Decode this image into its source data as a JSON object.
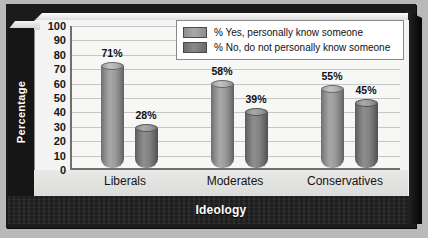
{
  "chart_data": {
    "type": "bar",
    "title": "",
    "xlabel": "Ideology",
    "ylabel": "Percentage",
    "categories": [
      "Liberals",
      "Moderates",
      "Conservatives"
    ],
    "series": [
      {
        "name": "% Yes, personally know someone",
        "values": [
          71,
          58,
          55
        ],
        "labels": [
          "71%",
          "58%",
          "55%"
        ],
        "color": "#a0a0a0"
      },
      {
        "name": "% No, do not personally know someone",
        "values": [
          28,
          39,
          45
        ],
        "labels": [
          "28%",
          "39%",
          "45%"
        ],
        "color": "#7d7d7d"
      }
    ],
    "ylim": [
      0,
      100
    ],
    "yticks": [
      100,
      90,
      80,
      70,
      60,
      50,
      40,
      30,
      20,
      10,
      0
    ],
    "ytick_labels": [
      "100",
      "90",
      "80",
      "70",
      "60",
      "50",
      "40",
      "30",
      "20",
      "10",
      "0"
    ],
    "grid": true,
    "legend_position": "top-right",
    "style": "3d-cylinder"
  },
  "axes": {
    "y_title": "Percentage",
    "x_title": "Ideology"
  },
  "legend": {
    "items": [
      {
        "label": "% Yes, personally know someone"
      },
      {
        "label": "% No, do not personally know someone"
      }
    ]
  },
  "colors": {
    "background": "#b9b9b9",
    "frame_dark": "#1b1b1b",
    "plot_background": "#f7f7f5",
    "gridline": "#c6c6c6",
    "axis_line": "#6f6f6f",
    "bar_yes": "#a0a0a0",
    "bar_no": "#7d7d7d",
    "text_dark": "#111111",
    "text_light": "#ffffff"
  }
}
